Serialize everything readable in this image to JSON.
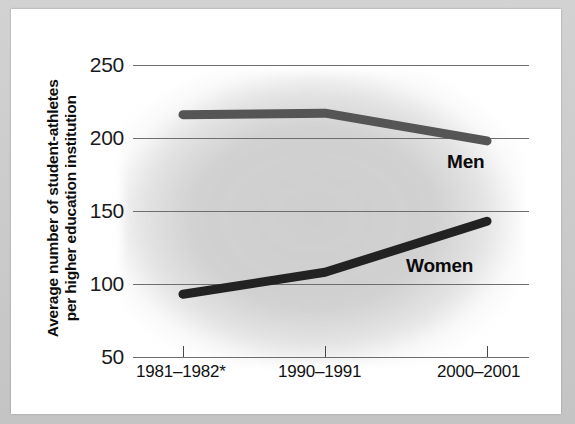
{
  "figure": {
    "kind": "line-chart",
    "page_background": "#ffffff",
    "frame_color": "#c9c9c9"
  },
  "chart_data": {
    "type": "line",
    "title": "",
    "xlabel": "",
    "ylabel": "Average number of student-athletes per higher education institution",
    "ylabel_line1": "Average number of student-athletes",
    "ylabel_line2": "per higher education institution",
    "categories": [
      "1981–1982*",
      "1990–1991",
      "2000–2001"
    ],
    "x": [
      0,
      1,
      2
    ],
    "ylim": [
      50,
      250
    ],
    "yticks": [
      250,
      200,
      150,
      100,
      50
    ],
    "ytick_labels": [
      "250",
      "200",
      "150",
      "100",
      "50"
    ],
    "grid": true,
    "legend_position": "inline-right",
    "series": [
      {
        "name": "Men",
        "label": "Men",
        "color": "#555555",
        "values": [
          216,
          217,
          198
        ]
      },
      {
        "name": "Women",
        "label": "Women",
        "color": "#222222",
        "values": [
          93,
          108,
          143
        ]
      }
    ],
    "annotations": [
      {
        "text": "Men",
        "series": "Men"
      },
      {
        "text": "Women",
        "series": "Women"
      }
    ],
    "footnote_marker": "*"
  },
  "colors": {
    "gridline": "#6e6e6e",
    "men_line": "#555555",
    "women_line": "#222222",
    "text": "#111111",
    "plot_shading": "#969696"
  }
}
